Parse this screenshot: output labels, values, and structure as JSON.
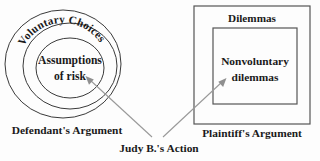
{
  "diagram": {
    "title_visible": false,
    "background_color": "#fdfdfd",
    "stroke_color": "#3a3a3a",
    "arrow_color": "#999999",
    "text_color": "#1a1a1a",
    "left_group": {
      "outer_circle_label": "Voluntary Choices",
      "inner_circle_label_line1": "Assumptions",
      "inner_circle_label_line2": "of risk",
      "caption": "Defendant's Argument"
    },
    "right_group": {
      "outer_rect_label": "Dilemmas",
      "inner_rect_label_line1": "Nonvoluntary",
      "inner_rect_label_line2": "dilemmas",
      "caption": "Plaintiff's Argument"
    },
    "center": {
      "action_label": "Judy B.'s Action",
      "arrow_left_name": "arrow-to-assumptions-of-risk",
      "arrow_right_name": "arrow-to-nonvoluntary-dilemmas"
    }
  }
}
